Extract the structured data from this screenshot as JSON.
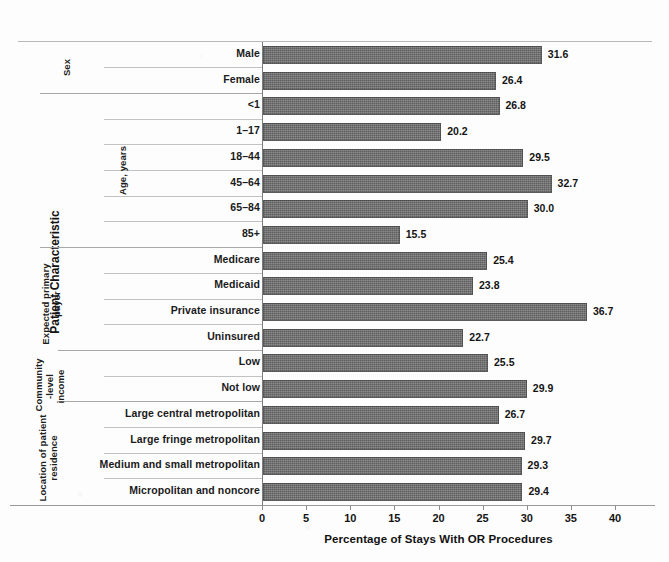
{
  "chart_data": {
    "type": "bar",
    "orientation": "horizontal",
    "title": "",
    "xlabel": "Percentage of Stays With OR Procedures",
    "ylabel": "Patient Characteristic",
    "xlim": [
      0,
      40
    ],
    "xticks": [
      0,
      5,
      10,
      15,
      20,
      25,
      30,
      35,
      40
    ],
    "grid": false,
    "legend": null,
    "bar_color": "#5e5e5e",
    "categories": [
      "Male",
      "Female",
      "<1",
      "1–17",
      "18–44",
      "45–64",
      "65–84",
      "85+",
      "Medicare",
      "Medicaid",
      "Private insurance",
      "Uninsured",
      "Low",
      "Not low",
      "Large central metropolitan",
      "Large fringe metropolitan",
      "Medium and small metropolitan",
      "Micropolitan and noncore"
    ],
    "values": [
      31.6,
      26.4,
      26.8,
      20.2,
      29.5,
      32.7,
      30.0,
      15.5,
      25.4,
      23.8,
      36.7,
      22.7,
      25.5,
      29.9,
      26.7,
      29.7,
      29.3,
      29.4
    ],
    "value_labels": [
      "31.6",
      "26.4",
      "26.8",
      "20.2",
      "29.5",
      "32.7",
      "30.0",
      "15.5",
      "25.4",
      "23.8",
      "36.7",
      "22.7",
      "25.5",
      "29.9",
      "26.7",
      "29.7",
      "29.3",
      "29.4"
    ],
    "groups": [
      {
        "label": "Sex",
        "start": 0,
        "count": 2
      },
      {
        "label": "Age, years",
        "start": 2,
        "count": 6
      },
      {
        "label": "Expected primary\npayer",
        "start": 8,
        "count": 4
      },
      {
        "label": "Community\n-level\nincome",
        "start": 12,
        "count": 2
      },
      {
        "label": "Location of patient\nresidence",
        "start": 14,
        "count": 4
      }
    ]
  },
  "axis": {
    "y_title": "Patient Characteristic",
    "x_title": "Percentage of Stays With OR Procedures",
    "x_tick_labels": [
      "0",
      "5",
      "10",
      "15",
      "20",
      "25",
      "30",
      "35",
      "40"
    ]
  }
}
